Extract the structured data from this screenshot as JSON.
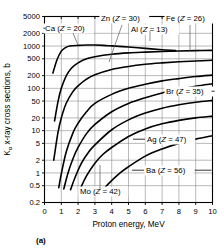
{
  "figure": {
    "caption": "(a)",
    "xlabel": "Proton energy, MeV",
    "ylabel_prefix": "K",
    "ylabel_sub": "α",
    "ylabel_rest": " x-ray cross sections, b",
    "ylabel_full": "Kα x-ray cross sections, b"
  },
  "chart_data": {
    "type": "line",
    "title": "",
    "xlabel": "Proton energy, MeV",
    "ylabel": "Kα x-ray cross sections, b",
    "xscale": "linear",
    "yscale": "log",
    "xlim": [
      0,
      10
    ],
    "ylim": [
      0.2,
      5000
    ],
    "grid": true,
    "legend_position": "inline-annotations",
    "xticks": [
      0,
      1,
      2,
      3,
      4,
      5,
      6,
      7,
      8,
      9,
      10
    ],
    "xticklabels": [
      "0",
      "1",
      "2",
      "3",
      "4",
      "5",
      "6",
      "7",
      "8",
      "9",
      "10"
    ],
    "yticks": [
      0.2,
      0.5,
      1,
      2,
      5,
      10,
      20,
      50,
      100,
      200,
      500,
      1000,
      2000,
      5000
    ],
    "yticklabels": [
      "0.2",
      "0.5",
      "1",
      "2",
      "5",
      "10",
      "20",
      "50",
      "100",
      "200",
      "500",
      "1000",
      "2000",
      "5000"
    ],
    "series": [
      {
        "name": "Al (Z = 13)",
        "element": "Al",
        "Z": 13,
        "label": "Al (Z = 13)",
        "x": [
          0.5,
          0.75,
          1.0,
          1.25,
          1.5,
          2.0,
          2.5,
          3.0,
          3.5,
          4.0,
          5.0,
          6.0,
          7.0,
          7.8
        ],
        "y": [
          230,
          480,
          760,
          920,
          1000,
          1040,
          1060,
          1060,
          1040,
          1010,
          950,
          880,
          820,
          780
        ]
      },
      {
        "name": "Ca (Z = 20)",
        "element": "Ca",
        "Z": 20,
        "label": "Ca (Z = 20)",
        "x": [
          0.6,
          0.8,
          1.0,
          1.3,
          1.6,
          2.0,
          2.5,
          3.0,
          4.0,
          5.0,
          6.0,
          7.0,
          8.0,
          9.0,
          10.0
        ],
        "y": [
          17,
          48,
          100,
          200,
          300,
          400,
          500,
          560,
          640,
          690,
          720,
          745,
          765,
          780,
          790
        ]
      },
      {
        "name": "Fe (Z = 26)",
        "element": "Fe",
        "Z": 26,
        "label": "Fe (Z = 26)",
        "x": [
          0.55,
          0.8,
          1.0,
          1.3,
          1.7,
          2.0,
          2.5,
          3.0,
          4.0,
          5.0,
          6.0,
          7.0,
          8.0,
          9.0,
          10.0
        ],
        "y": [
          2.0,
          9.0,
          20,
          45,
          85,
          115,
          165,
          210,
          280,
          330,
          370,
          400,
          425,
          445,
          460
        ]
      },
      {
        "name": "Zn (Z = 30)",
        "element": "Zn",
        "Z": 30,
        "label": "Zn (Z = 30)",
        "x": [
          0.85,
          1.0,
          1.3,
          1.7,
          2.0,
          2.5,
          3.0,
          4.0,
          5.0,
          6.0,
          7.0,
          8.0,
          9.0,
          10.0
        ],
        "y": [
          0.45,
          0.95,
          3.2,
          9.0,
          15,
          28,
          44,
          72,
          100,
          125,
          150,
          170,
          190,
          205
        ]
      },
      {
        "name": "Br (Z = 35)",
        "element": "Br",
        "Z": 35,
        "label": "Br (Z = 35)",
        "x": [
          1.15,
          1.4,
          1.7,
          2.0,
          2.5,
          3.0,
          4.0,
          5.0,
          6.0,
          7.0,
          8.0,
          9.0,
          10.0
        ],
        "y": [
          0.42,
          1.0,
          2.2,
          4.0,
          8.5,
          14,
          28,
          44,
          60,
          78,
          95,
          112,
          128
        ]
      },
      {
        "name": "Mo (Z = 42)",
        "element": "Mo",
        "Z": 42,
        "label": "Mo (Z = 42)",
        "x": [
          1.55,
          1.8,
          2.2,
          2.6,
          3.0,
          4.0,
          5.0,
          6.0,
          7.0,
          8.0,
          9.0,
          10.0
        ],
        "y": [
          0.4,
          0.75,
          1.7,
          3.0,
          4.6,
          10.5,
          18,
          26,
          34,
          41,
          47,
          52
        ]
      },
      {
        "name": "Ag (Z = 47)",
        "element": "Ag",
        "Z": 47,
        "label": "Ag (Z = 47)",
        "x": [
          2.1,
          2.5,
          3.0,
          3.5,
          4.0,
          5.0,
          6.0,
          7.0,
          8.0,
          9.0,
          10.0
        ],
        "y": [
          0.4,
          0.85,
          1.7,
          2.8,
          4.0,
          7.3,
          11,
          14.5,
          17.5,
          20,
          22
        ]
      },
      {
        "name": "Ba (Z = 56)",
        "element": "Ba",
        "Z": 56,
        "label": "Ba (Z = 56)",
        "x": [
          3.3,
          3.8,
          4.5,
          5.0,
          6.0,
          7.0,
          8.0,
          9.0,
          10.0
        ],
        "y": [
          0.32,
          0.55,
          1.0,
          1.4,
          2.5,
          3.7,
          5.0,
          6.3,
          7.6
        ]
      }
    ],
    "annotations": [
      {
        "text": "Ca (Z = 20)",
        "series": "Ca",
        "x_px": 45,
        "y_px": 31
      },
      {
        "text": "Zn (Z = 30)",
        "series": "Zn",
        "x_px": 101,
        "y_px": 21
      },
      {
        "text": "Fe (Z = 26)",
        "series": "Fe",
        "x_px": 166,
        "y_px": 21
      },
      {
        "text": "Al (Z = 13)",
        "series": "Al",
        "x_px": 131,
        "y_px": 32
      },
      {
        "text": "Br (Z = 35)",
        "series": "Br",
        "x_px": 166,
        "y_px": 94
      },
      {
        "text": "Ag (Z = 47)",
        "series": "Ag",
        "x_px": 147,
        "y_px": 142
      },
      {
        "text": "Ba (Z = 56)",
        "series": "Ba",
        "x_px": 146,
        "y_px": 173
      },
      {
        "text": "Mo (Z = 42)",
        "series": "Mo",
        "x_px": 80,
        "y_px": 194
      }
    ]
  }
}
